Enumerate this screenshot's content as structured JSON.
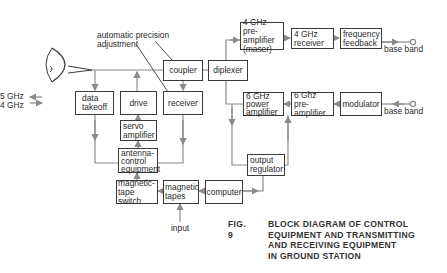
{
  "figure": {
    "number_label": "FIG. 9",
    "caption_lines": [
      "BLOCK DIAGRAM OF CONTROL",
      "EQUIPMENT AND TRANSMITTING",
      "AND RECEIVING EQUIPMENT",
      "IN GROUND STATION"
    ]
  },
  "left_labels": {
    "upper": "5 GHz",
    "lower": "4 GHz"
  },
  "annotations": {
    "automatic_precision_adjustment_line1": "automatic precision",
    "automatic_precision_adjustment_line2": "adjustment",
    "input": "input",
    "base_band_top": "base band",
    "base_band_bottom": "base band"
  },
  "blocks": {
    "coupler": "coupler",
    "diplexer": "diplexer",
    "preamp_4ghz": [
      "4 GHz pre-",
      "amplifier",
      "(maser)"
    ],
    "receiver_4ghz": [
      "4 GHz",
      "receiver"
    ],
    "frequency_feedback": [
      "frequency",
      "feedback"
    ],
    "power_amp_6ghz": [
      "6 GHz",
      "power",
      "amplifier"
    ],
    "preamp_6ghz": [
      "6 Ghz pre-",
      "amplifier"
    ],
    "modulator": "modulator",
    "data_takeoff": [
      "data",
      "takeoff"
    ],
    "drive": "drive",
    "receiver": "receiver",
    "servo_amplifier": [
      "servo",
      "amplifier"
    ],
    "antenna_control": [
      "antenna-",
      "control",
      "equipment"
    ],
    "magnetic_tape_switch": [
      "magnetic-",
      "tape switch"
    ],
    "magnetic_tapes": [
      "magnetic",
      "tapes"
    ],
    "computer": "computer",
    "output_regulator": [
      "output",
      "regulator"
    ]
  },
  "colors": {
    "line": "#8a8a8a",
    "box_border": "#3a3a3a",
    "text": "#2b2b2b"
  }
}
